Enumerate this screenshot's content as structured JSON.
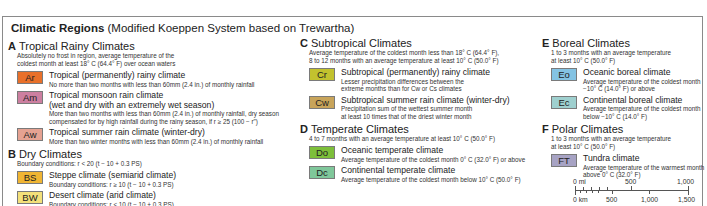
{
  "title": {
    "bold": "Climatic Regions",
    "normal": "(Modified Koeppen System based on Trewartha)"
  },
  "groups": {
    "A": {
      "letter": "A",
      "name": "Tropical Rainy Climates",
      "desc": [
        "Absolutely no frost in region, average temperature of the",
        "coldest month at least 18° C (64.4° F) over ocean waters"
      ],
      "items": [
        {
          "code": "Ar",
          "color": "#e8702a",
          "name": "Tropical (permanently) rainy climate",
          "desc": [
            "No more than two months with less than 60mm (2.4 in.) of monthly rainfall"
          ]
        },
        {
          "code": "Am",
          "color": "#cc7fa0",
          "name": "Tropical monsoon rain climate",
          "name2": "(wet and dry with an extremely wet season)",
          "desc": [
            "More than two months with less than 60mm (2.4 in.) of monthly rainfall, dry season",
            "compensated for by high rainfall during the rainy season, if r ≥ 25 (100 − r\")"
          ]
        },
        {
          "code": "Aw",
          "color": "#e5a292",
          "name": "Tropical summer rain climate (winter-dry)",
          "desc": [
            "More than two winter months with less than 60mm (2.4 in.) of monthly rainfall"
          ]
        }
      ]
    },
    "B": {
      "letter": "B",
      "name": "Dry Climates",
      "desc": [
        "Boundary conditions: r < 20 (t − 10 + 0.3 PS)"
      ],
      "items": [
        {
          "code": "BS",
          "color": "#f0b533",
          "name": "Steppe climate (semiarid climate)",
          "desc": [
            "Boundary conditions: r ≥ 10 (t − 10 + 0.3 PS)"
          ]
        },
        {
          "code": "BW",
          "color": "#f3e07a",
          "name": "Desert climate (arid climate)",
          "desc": [
            "Boundary conditions: r < 10 (t − 10 + 0.3 PS)"
          ]
        }
      ]
    },
    "C": {
      "letter": "C",
      "name": "Subtropical Climates",
      "desc": [
        "Average temperature of the coldest month less than 18° C (64.4° F),",
        "8 to 12 months with an average temperature at least 10° C (50.0° F)"
      ],
      "items": [
        {
          "code": "Cr",
          "color": "#c2c22e",
          "name": "Subtropical (permanently) rainy climate",
          "desc": [
            "Lesser precipitation differences between the",
            "extreme months than for Cw or Cs climates"
          ]
        },
        {
          "code": "Cw",
          "color": "#c8a45a",
          "name": "Subtropical summer rain climate (winter-dry)",
          "desc": [
            "Precipitation sum of the wettest summer month",
            "at least 10 times that of the driest winter month"
          ]
        }
      ]
    },
    "D": {
      "letter": "D",
      "name": "Temperate Climates",
      "desc": [
        "4 to 7 months with an average temperature at least 10° C (50.0° F)"
      ],
      "items": [
        {
          "code": "Do",
          "color": "#7dbf3a",
          "name": "Oceanic temperate climate",
          "desc": [
            "Average temperature of the coldest month 0° C (32.0° F) or above"
          ]
        },
        {
          "code": "Dc",
          "color": "#7fc79a",
          "name": "Continental temperate climate",
          "desc": [
            "Average temperature of the coldest month below 10° C (50.0° F)"
          ]
        }
      ]
    },
    "E": {
      "letter": "E",
      "name": "Boreal Climates",
      "desc": [
        "1 to 3 months with an average temperature",
        "at least 10° C (50.0° F)"
      ],
      "items": [
        {
          "code": "Eo",
          "color": "#84c3e3",
          "name": "Oceanic boreal climate",
          "desc": [
            "Average temperature of the coldest month",
            "−10° C (14.0° F) or above"
          ]
        },
        {
          "code": "Ec",
          "color": "#9fd0cf",
          "name": "Continental boreal climate",
          "desc": [
            "Average temperature of the coldest month",
            "below −10° C (14.0° F)"
          ]
        }
      ]
    },
    "F": {
      "letter": "F",
      "name": "Polar Climates",
      "desc": [
        "1 to 3 months with an average temperature",
        "at least 10° C (50.0° F)"
      ],
      "items": [
        {
          "code": "FT",
          "color": "#a7a3c4",
          "name": "Tundra climate",
          "desc": [
            "Average temperature of the warmest month",
            "above 0° C (32.0° F)"
          ]
        }
      ]
    }
  },
  "scale": {
    "mi_labels": [
      "0 mi",
      "500",
      "1,000"
    ],
    "km_labels": [
      "0 km",
      "500",
      "1,000",
      "1,500"
    ]
  }
}
